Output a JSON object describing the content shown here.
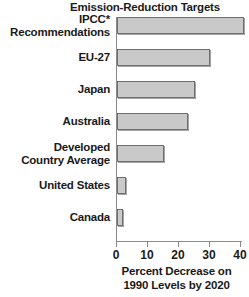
{
  "chart_data": {
    "type": "bar",
    "orientation": "horizontal",
    "title": "Emission-Reduction Targets",
    "xlabel_line1": "Percent Decrease on",
    "xlabel_line2": "1990 Levels by 2020",
    "ylabel": "",
    "xlim": [
      0,
      41
    ],
    "xticks": [
      0,
      10,
      20,
      30,
      40
    ],
    "xticklabels": [
      "0",
      "10",
      "20",
      "30",
      "40"
    ],
    "grid": false,
    "legend": false,
    "bar_fill_color": "#c9c9c9",
    "bar_edge_color": "#6e6e6e",
    "text_color": "#1a1a1a",
    "background_color": "#ffffff",
    "categories": [
      "IPCC* Recommendations",
      "EU-27",
      "Japan",
      "Australia",
      "Developed Country Average",
      "United States",
      "Canada"
    ],
    "values": [
      41,
      30,
      25,
      23,
      15,
      3,
      2
    ],
    "rows": [
      {
        "label_line1": "IPCC*",
        "label_line2": "Recommendations",
        "value": 41
      },
      {
        "label_line1": "EU-27",
        "label_line2": "",
        "value": 30
      },
      {
        "label_line1": "Japan",
        "label_line2": "",
        "value": 25
      },
      {
        "label_line1": "Australia",
        "label_line2": "",
        "value": 23
      },
      {
        "label_line1": "Developed",
        "label_line2": "Country Average",
        "value": 15
      },
      {
        "label_line1": "United States",
        "label_line2": "",
        "value": 3
      },
      {
        "label_line1": "Canada",
        "label_line2": "",
        "value": 2
      }
    ]
  }
}
